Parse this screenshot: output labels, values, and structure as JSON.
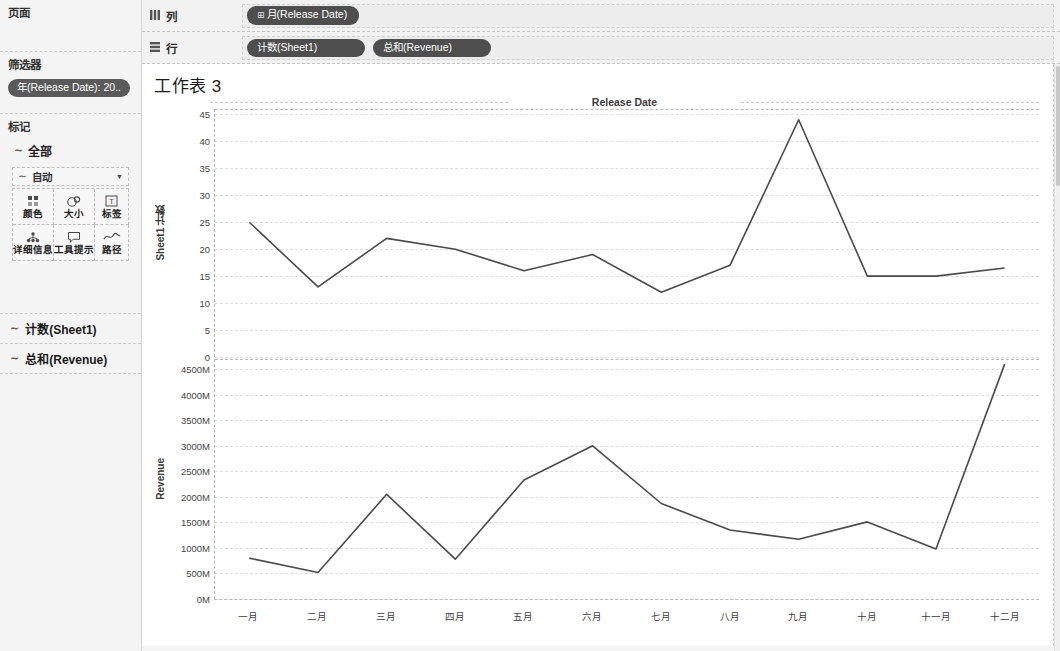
{
  "sidebar": {
    "pages": {
      "title": "页面"
    },
    "filters": {
      "title": "筛选器",
      "pills": [
        "年(Release Date): 20.."
      ]
    },
    "marks": {
      "title": "标记",
      "all_label": "全部",
      "all_icon": "line-mark-icon",
      "mark_type": {
        "label": "自动",
        "icon": "line-mark-icon",
        "caret": "▼"
      },
      "buttons": [
        {
          "name": "color",
          "label": "颜色",
          "icon": "color-dots-icon"
        },
        {
          "name": "size",
          "label": "大小",
          "icon": "size-circles-icon"
        },
        {
          "name": "label",
          "label": "标签",
          "icon": "text-label-icon"
        },
        {
          "name": "detail",
          "label": "详细信息",
          "icon": "detail-dots-icon"
        },
        {
          "name": "tooltip",
          "label": "工具提示",
          "icon": "tooltip-bubble-icon"
        },
        {
          "name": "path",
          "label": "路径",
          "icon": "path-line-icon"
        }
      ]
    },
    "measure_cards": [
      {
        "label": "计数(Sheet1)",
        "icon": "line-mark-icon"
      },
      {
        "label": "总和(Revenue)",
        "icon": "line-mark-icon"
      }
    ]
  },
  "shelves": {
    "columns": {
      "label": "列",
      "icon": "columns-grid-icon",
      "pills": [
        {
          "prefix": "⊞",
          "text": "月(Release Date)"
        }
      ]
    },
    "rows": {
      "label": "行",
      "icon": "rows-grid-icon",
      "pills": [
        {
          "prefix": "",
          "text": "计数(Sheet1)"
        },
        {
          "prefix": "",
          "text": "总和(Revenue)"
        }
      ]
    }
  },
  "view": {
    "worksheet_title": "工作表 3",
    "chart_title": "Release Date"
  },
  "colors": {
    "line": "#4a4a4a",
    "pill_bg": "#4e4e4e",
    "panel_bg": "#f4f4f4",
    "grid": "#dedede",
    "axis": "#b9b9b9"
  },
  "chart_data": [
    {
      "type": "line",
      "title": "Release Date",
      "ylabel": "Sheet1 计数",
      "xlabel": "",
      "grid": true,
      "legend": "none",
      "x": [
        "一月",
        "二月",
        "三月",
        "四月",
        "五月",
        "六月",
        "七月",
        "八月",
        "九月",
        "十月",
        "十一月",
        "十二月"
      ],
      "categories": [
        "一月",
        "二月",
        "三月",
        "四月",
        "五月",
        "六月",
        "七月",
        "八月",
        "九月",
        "十月",
        "十一月",
        "十二月"
      ],
      "values": [
        25,
        13,
        22,
        20,
        16,
        19,
        12,
        17,
        44,
        15,
        15,
        16.5
      ],
      "ylim": [
        0,
        46
      ],
      "yticks": [
        0,
        5,
        10,
        15,
        20,
        25,
        30,
        35,
        40,
        45
      ],
      "ytick_labels": [
        "0",
        "5",
        "10",
        "15",
        "20",
        "25",
        "30",
        "35",
        "40",
        "45"
      ]
    },
    {
      "type": "line",
      "title": "",
      "ylabel": "Revenue",
      "xlabel": "",
      "grid": true,
      "legend": "none",
      "x": [
        "一月",
        "二月",
        "三月",
        "四月",
        "五月",
        "六月",
        "七月",
        "八月",
        "九月",
        "十月",
        "十一月",
        "十二月"
      ],
      "categories": [
        "一月",
        "二月",
        "三月",
        "四月",
        "五月",
        "六月",
        "七月",
        "八月",
        "九月",
        "十月",
        "十一月",
        "十二月"
      ],
      "values": [
        800,
        520,
        2050,
        780,
        2330,
        3000,
        1870,
        1350,
        1170,
        1510,
        980,
        4600
      ],
      "unit": "M",
      "ylim": [
        0,
        4700
      ],
      "yticks": [
        0,
        500,
        1000,
        1500,
        2000,
        2500,
        3000,
        3500,
        4000,
        4500
      ],
      "ytick_labels": [
        "0M",
        "500M",
        "1000M",
        "1500M",
        "2000M",
        "2500M",
        "3000M",
        "3500M",
        "4000M",
        "4500M"
      ]
    }
  ]
}
